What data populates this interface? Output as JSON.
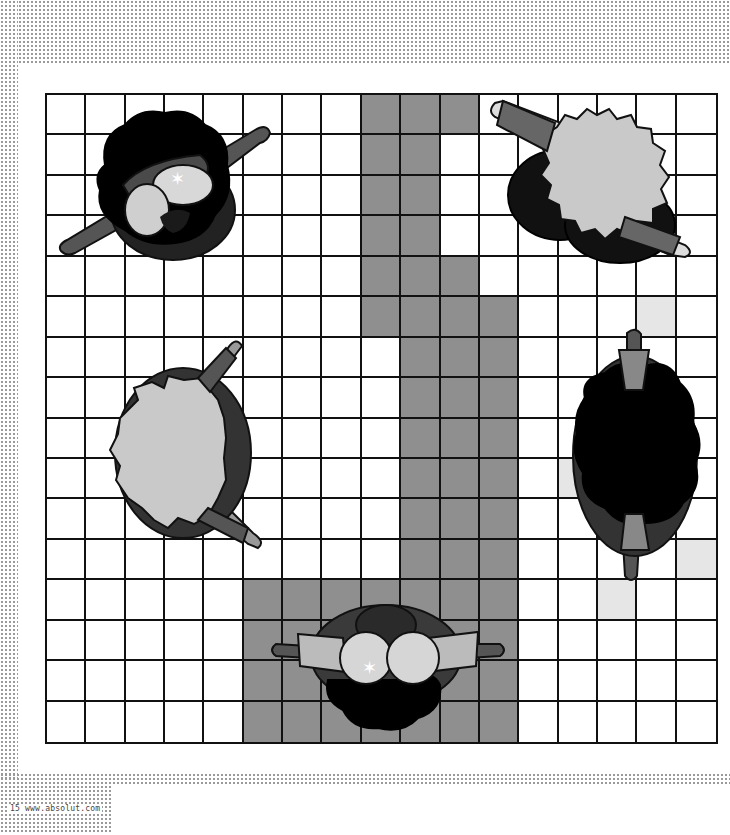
{
  "page": {
    "number": "15",
    "url": "www.absolut.com"
  },
  "board": {
    "columns": 17,
    "rows": 16,
    "colors": {
      "line": "#111111",
      "empty": "#ffffff",
      "path": "#8f8f8f",
      "hint": "#e6e6e6"
    },
    "path_cells": [
      [
        0,
        8
      ],
      [
        0,
        9
      ],
      [
        0,
        10
      ],
      [
        1,
        8
      ],
      [
        1,
        9
      ],
      [
        2,
        8
      ],
      [
        2,
        9
      ],
      [
        3,
        8
      ],
      [
        3,
        9
      ],
      [
        4,
        8
      ],
      [
        4,
        9
      ],
      [
        4,
        10
      ],
      [
        5,
        8
      ],
      [
        5,
        9
      ],
      [
        5,
        10
      ],
      [
        5,
        11
      ],
      [
        6,
        9
      ],
      [
        6,
        10
      ],
      [
        6,
        11
      ],
      [
        7,
        9
      ],
      [
        7,
        10
      ],
      [
        7,
        11
      ],
      [
        8,
        9
      ],
      [
        8,
        10
      ],
      [
        8,
        11
      ],
      [
        9,
        9
      ],
      [
        9,
        10
      ],
      [
        9,
        11
      ],
      [
        10,
        9
      ],
      [
        10,
        10
      ],
      [
        10,
        11
      ],
      [
        11,
        9
      ],
      [
        11,
        10
      ],
      [
        11,
        11
      ],
      [
        12,
        5
      ],
      [
        12,
        6
      ],
      [
        12,
        7
      ],
      [
        12,
        8
      ],
      [
        12,
        9
      ],
      [
        12,
        10
      ],
      [
        12,
        11
      ],
      [
        13,
        5
      ],
      [
        13,
        6
      ],
      [
        13,
        7
      ],
      [
        13,
        8
      ],
      [
        13,
        9
      ],
      [
        13,
        10
      ],
      [
        13,
        11
      ],
      [
        14,
        5
      ],
      [
        14,
        6
      ],
      [
        14,
        7
      ],
      [
        14,
        8
      ],
      [
        14,
        9
      ],
      [
        14,
        10
      ],
      [
        14,
        11
      ],
      [
        15,
        5
      ],
      [
        15,
        6
      ],
      [
        15,
        7
      ],
      [
        15,
        8
      ],
      [
        15,
        9
      ],
      [
        15,
        10
      ],
      [
        15,
        11
      ]
    ],
    "hint_cells": [
      [
        5,
        15
      ],
      [
        7,
        14
      ],
      [
        9,
        13
      ],
      [
        11,
        16
      ],
      [
        12,
        14
      ]
    ]
  },
  "characters": [
    {
      "id": "top-left",
      "hair": "black-afro",
      "glasses": true,
      "mustache": true,
      "pose": "arms-diagonal"
    },
    {
      "id": "top-right",
      "hair": "light-gray-fluffy",
      "glasses": false,
      "pose": "arms-diagonal"
    },
    {
      "id": "middle-left",
      "hair": "light-gray-fluffy",
      "glasses": false,
      "pose": "arms-diagonal"
    },
    {
      "id": "middle-right",
      "hair": "black-afro",
      "glasses": false,
      "pose": "arms-vertical"
    },
    {
      "id": "bottom-center",
      "hair": "black-afro",
      "glasses": true,
      "pose": "arms-horizontal"
    }
  ]
}
